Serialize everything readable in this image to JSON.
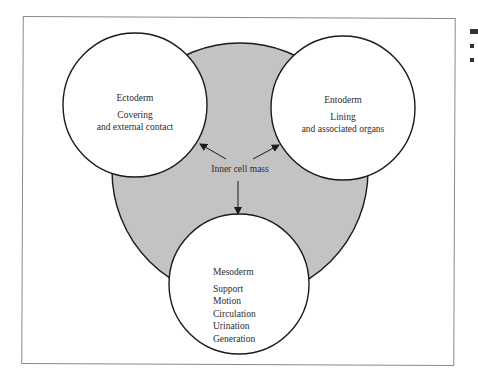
{
  "diagram": {
    "center": {
      "label": "Inner cell mass",
      "fill": "#c3c3c3"
    },
    "layers": [
      {
        "name": "Ectoderm",
        "lines": [
          "Covering",
          "and external contact"
        ]
      },
      {
        "name": "Entoderm",
        "lines": [
          "Lining",
          "and associated organs"
        ]
      },
      {
        "name": "Mesoderm",
        "lines": [
          "Support",
          "Motion",
          "Circulation",
          "Urination",
          "Generation"
        ]
      }
    ]
  }
}
